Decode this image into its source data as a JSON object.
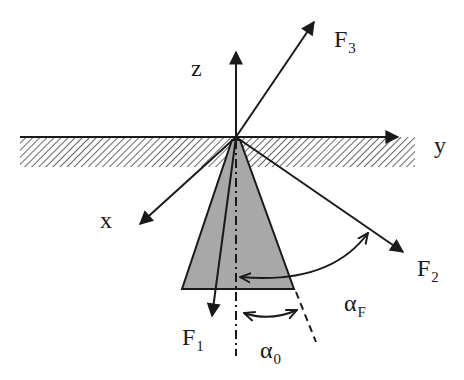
{
  "diagram": {
    "type": "force-diagram",
    "axes": {
      "x": {
        "label": "x"
      },
      "y": {
        "label": "y"
      },
      "z": {
        "label": "z"
      }
    },
    "forces": [
      {
        "name": "F",
        "sub": "1"
      },
      {
        "name": "F",
        "sub": "2"
      },
      {
        "name": "F",
        "sub": "3"
      }
    ],
    "angles": [
      {
        "symbol": "α",
        "sub": "0"
      },
      {
        "symbol": "α",
        "sub": "F"
      }
    ],
    "colors": {
      "line": "#1a1a1a",
      "cone_fill": "#a8a8a8",
      "hatch": "#555555"
    }
  }
}
